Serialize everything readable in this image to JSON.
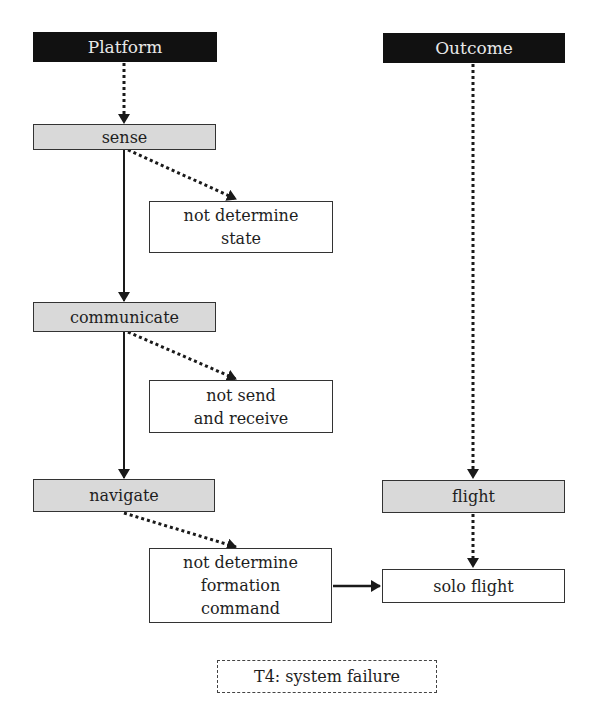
{
  "diagram": {
    "type": "flowchart",
    "columns": {
      "left": {
        "header": "Platform"
      },
      "right": {
        "header": "Outcome"
      }
    },
    "nodes": {
      "platform": {
        "label": "Platform",
        "style": "header"
      },
      "outcome": {
        "label": "Outcome",
        "style": "header"
      },
      "sense": {
        "label": "sense",
        "style": "process"
      },
      "not_determine_state": {
        "label": "not determine\nstate",
        "style": "failure"
      },
      "communicate": {
        "label": "communicate",
        "style": "process"
      },
      "not_send_receive": {
        "label": "not send\nand receive",
        "style": "failure"
      },
      "navigate": {
        "label": "navigate",
        "style": "process"
      },
      "not_determine_formation": {
        "label": "not determine\nformation\ncommand",
        "style": "failure"
      },
      "flight": {
        "label": "flight",
        "style": "process"
      },
      "solo_flight": {
        "label": "solo flight",
        "style": "result"
      }
    },
    "edges": [
      {
        "from": "platform",
        "to": "sense",
        "style": "dotted"
      },
      {
        "from": "sense",
        "to": "not_determine_state",
        "style": "dotted"
      },
      {
        "from": "sense",
        "to": "communicate",
        "style": "solid"
      },
      {
        "from": "communicate",
        "to": "not_send_receive",
        "style": "dotted"
      },
      {
        "from": "communicate",
        "to": "navigate",
        "style": "solid"
      },
      {
        "from": "navigate",
        "to": "not_determine_formation",
        "style": "dotted"
      },
      {
        "from": "not_determine_formation",
        "to": "solo_flight",
        "style": "solid"
      },
      {
        "from": "outcome",
        "to": "flight",
        "style": "dotted"
      },
      {
        "from": "flight",
        "to": "solo_flight",
        "style": "dotted"
      }
    ],
    "legend": {
      "label": "T4: system failure",
      "style": "dashed"
    },
    "colors": {
      "header_bg": "#111111",
      "header_text": "#e8e8e8",
      "process_bg": "#d9d9d9",
      "border": "#333333",
      "arrow": "#1a1a1a"
    }
  }
}
